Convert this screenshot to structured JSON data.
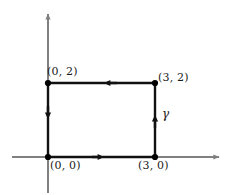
{
  "figure": {
    "kind": "contour-integral-diagram",
    "width": 230,
    "height": 195,
    "colors": {
      "axis": "#808080",
      "contour": "#111111",
      "node": "#000000",
      "text": "#1a1a1a",
      "background": "#ffffff"
    }
  },
  "axes": {
    "x_axis_name": "x-axis",
    "y_axis_name": "y-axis",
    "origin_px": {
      "x": 48,
      "y": 157
    },
    "x_extent_px": {
      "from": 12,
      "to": 220
    },
    "y_extent_px": {
      "from": 12,
      "to": 193
    },
    "arrowheads": [
      "x-positive",
      "y-positive"
    ]
  },
  "contour": {
    "label": "γ",
    "orientation": "counterclockwise",
    "vertices": [
      {
        "label": "(0, 0)",
        "x": 0,
        "y": 0,
        "px": {
          "x": 48,
          "y": 157
        }
      },
      {
        "label": "(3, 0)",
        "x": 3,
        "y": 0,
        "px": {
          "x": 155,
          "y": 157
        }
      },
      {
        "label": "(3, 2)",
        "x": 3,
        "y": 2,
        "px": {
          "x": 155,
          "y": 83
        }
      },
      {
        "label": "(0, 2)",
        "x": 0,
        "y": 2,
        "px": {
          "x": 48,
          "y": 83
        }
      }
    ],
    "edges": [
      {
        "name": "bottom-edge",
        "from": "(0, 0)",
        "to": "(3, 0)",
        "direction": "right"
      },
      {
        "name": "right-edge",
        "from": "(3, 0)",
        "to": "(3, 2)",
        "direction": "up"
      },
      {
        "name": "top-edge",
        "from": "(3, 2)",
        "to": "(0, 2)",
        "direction": "left"
      },
      {
        "name": "left-edge",
        "from": "(0, 2)",
        "to": "(0, 0)",
        "direction": "down"
      }
    ]
  },
  "labels": {
    "origin": "(0, 0)",
    "bottom_right": "(3, 0)",
    "top_left": "(0, 2)",
    "top_right": "(3, 2)",
    "curve": "γ"
  }
}
